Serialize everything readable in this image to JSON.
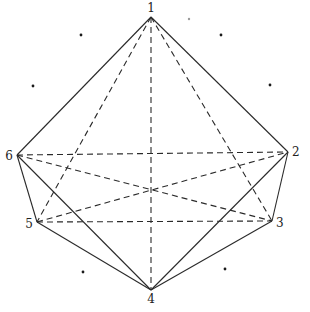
{
  "diagram": {
    "type": "octahedron-projection",
    "colors": {
      "stroke": "#2a2a2a",
      "dot": "#1a1a1a",
      "faint_dot": "#9a9a9a",
      "background": "#ffffff"
    },
    "vertices": [
      {
        "id": "1",
        "label": "1",
        "x": 151,
        "y": 17,
        "lx": 151,
        "ly": 12,
        "anchor": "middle"
      },
      {
        "id": "2",
        "label": "2",
        "x": 288,
        "y": 152,
        "lx": 292,
        "ly": 156,
        "anchor": "start"
      },
      {
        "id": "3",
        "label": "3",
        "x": 272,
        "y": 221,
        "lx": 276,
        "ly": 227,
        "anchor": "start"
      },
      {
        "id": "4",
        "label": "4",
        "x": 151,
        "y": 290,
        "lx": 151,
        "ly": 303,
        "anchor": "middle"
      },
      {
        "id": "5",
        "label": "5",
        "x": 37,
        "y": 222,
        "lx": 33,
        "ly": 228,
        "anchor": "end"
      },
      {
        "id": "6",
        "label": "6",
        "x": 17,
        "y": 155,
        "lx": 13,
        "ly": 160,
        "anchor": "end"
      }
    ],
    "solid_edges": [
      [
        "1",
        "6"
      ],
      [
        "1",
        "2"
      ],
      [
        "6",
        "5"
      ],
      [
        "2",
        "3"
      ],
      [
        "5",
        "4"
      ],
      [
        "3",
        "4"
      ],
      [
        "6",
        "4"
      ],
      [
        "2",
        "4"
      ]
    ],
    "dashed_edges": [
      [
        "1",
        "4"
      ],
      [
        "1",
        "5"
      ],
      [
        "1",
        "3"
      ],
      [
        "6",
        "2"
      ],
      [
        "6",
        "3"
      ],
      [
        "5",
        "2"
      ],
      [
        "5",
        "3"
      ]
    ],
    "dots": [
      {
        "x": 81,
        "y": 35,
        "faint": false
      },
      {
        "x": 221,
        "y": 35,
        "faint": false
      },
      {
        "x": 33,
        "y": 86,
        "faint": false
      },
      {
        "x": 270,
        "y": 85,
        "faint": false
      },
      {
        "x": 83,
        "y": 272,
        "faint": false
      },
      {
        "x": 225,
        "y": 269,
        "faint": false
      },
      {
        "x": 189,
        "y": 19,
        "faint": true
      }
    ]
  }
}
